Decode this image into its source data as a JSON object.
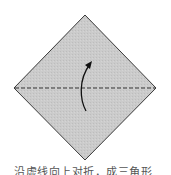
{
  "figure": {
    "type": "origami-fold-step",
    "shape": "square-rotated-45",
    "fill_color": "#c9c9c9",
    "stroke_color": "#3a3a3a",
    "fold_line": {
      "style": "dashed",
      "orientation": "horizontal",
      "label": "valley-fold-line"
    },
    "arrow": {
      "direction": "up",
      "meaning": "fold-bottom-half-up"
    }
  },
  "top_strip_text": "· · · · · · · · · · · · · · · · · · · · · · · ·",
  "caption": "沿虚线向上对折，成三角形"
}
